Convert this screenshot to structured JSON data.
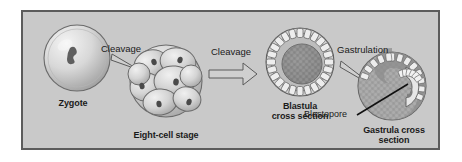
{
  "figure": {
    "background_color": "#ffffff",
    "panel_color": "#c9c9c9",
    "border_color": "#5c5c5c",
    "text_color": "#1a1a1a"
  },
  "stages": [
    {
      "id": "zygote",
      "label": "Zygote",
      "description": "single pale spherical cell with a small dark nucleus"
    },
    {
      "id": "eight-cell-stage",
      "label": "Eight-cell stage",
      "description": "cluster of eight overlapping rounded cells each with a dark nucleus"
    },
    {
      "id": "blastula",
      "label": "Blastula\ncross section",
      "label_line1": "Blastula",
      "label_line2": "cross section",
      "description": "hollow ball with an outer ring of small cells around a darker inner mass"
    },
    {
      "id": "gastrula",
      "label": "Gastrula cross\nsection",
      "label_line1": "Gastrula cross",
      "label_line2": "section",
      "description": "invaginated embryo with archenteron lined by cells"
    }
  ],
  "transitions": [
    {
      "id": "cleavage-1",
      "label": "Cleavage"
    },
    {
      "id": "cleavage-2",
      "label": "Cleavage"
    },
    {
      "id": "gastrulation",
      "label": "Gastrulation"
    }
  ],
  "annotations": [
    {
      "id": "blastopore",
      "label": "Blastopore"
    }
  ]
}
